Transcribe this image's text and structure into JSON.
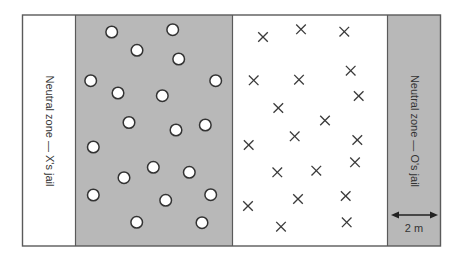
{
  "field": {
    "colors": {
      "border": "#5a5a5a",
      "shaded": "#b8b8b8",
      "white": "#ffffff",
      "marker_stroke": "#333333"
    },
    "left_jail": {
      "label": "Neutral zone — X's jail"
    },
    "right_jail": {
      "label": "Neutral zone — O's jail"
    },
    "scale": {
      "label": "2 m"
    }
  },
  "o_players": [
    [
      111.7,
      32
    ],
    [
      172.7,
      29.7
    ],
    [
      137,
      50.3
    ],
    [
      178.7,
      59
    ],
    [
      90.7,
      80.7
    ],
    [
      215.7,
      80.7
    ],
    [
      118,
      93
    ],
    [
      162.3,
      95.7
    ],
    [
      129,
      122.5
    ],
    [
      176,
      130
    ],
    [
      205.3,
      125
    ],
    [
      93.3,
      147
    ],
    [
      153.3,
      167.3
    ],
    [
      189.3,
      172.3
    ],
    [
      124,
      177.7
    ],
    [
      93.3,
      195
    ],
    [
      210.7,
      194.7
    ],
    [
      165.7,
      200.3
    ],
    [
      136.7,
      222.3
    ],
    [
      202,
      222.7
    ]
  ],
  "x_players": [
    [
      263,
      37
    ],
    [
      301,
      29.3
    ],
    [
      344.3,
      31.7
    ],
    [
      253.7,
      80.3
    ],
    [
      299,
      79.7
    ],
    [
      350.7,
      70.7
    ],
    [
      358.7,
      96
    ],
    [
      278.3,
      108
    ],
    [
      325,
      120.5
    ],
    [
      294.7,
      136.3
    ],
    [
      248.7,
      145
    ],
    [
      357.3,
      140
    ],
    [
      355,
      162.3
    ],
    [
      277.3,
      172.3
    ],
    [
      316.3,
      170.7
    ],
    [
      345.7,
      196
    ],
    [
      298,
      199
    ],
    [
      248,
      206
    ],
    [
      281,
      226.7
    ],
    [
      346.7,
      222.3
    ]
  ]
}
